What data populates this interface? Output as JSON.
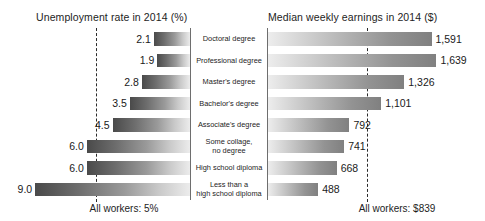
{
  "chart_data": {
    "type": "bar",
    "layout": "back-to-back horizontal bar (tornado) chart",
    "categories": [
      "Doctoral degree",
      "Professional degree",
      "Master's degree",
      "Bachelor's degree",
      "Associate's degree",
      "Some collage,\nno degree",
      "High school diploma",
      "Less than a\nhigh school diploma"
    ],
    "series": [
      {
        "name": "Unemployment rate in 2014 (%)",
        "side": "left",
        "unit": "%",
        "values": [
          2.1,
          1.9,
          2.8,
          3.5,
          4.5,
          6.0,
          6.0,
          9.0
        ],
        "labels": [
          "2.1",
          "1.9",
          "2.8",
          "3.5",
          "4.5",
          "6.0",
          "6.0",
          "9.0"
        ],
        "axis_max": 10.0,
        "reference_line": {
          "value": 5,
          "label": "All workers: 5%"
        }
      },
      {
        "name": "Median weekly earnings in 2014 ($)",
        "side": "right",
        "unit": "$",
        "values": [
          1591,
          1639,
          1326,
          1101,
          792,
          741,
          668,
          488
        ],
        "labels": [
          "1,591",
          "1,639",
          "1,326",
          "1,101",
          "792",
          "741",
          "668",
          "488"
        ],
        "axis_max": 1800,
        "reference_line": {
          "value": 839,
          "label": "All workers: $839"
        }
      }
    ],
    "grid": false,
    "legend": "none"
  },
  "panels": {
    "left": {
      "title": "Unemployment rate in 2014 (%)",
      "footnote": "All workers: 5%"
    },
    "right": {
      "title": "Median weekly earnings in 2014 ($)",
      "footnote": "All workers: $839"
    }
  },
  "rows": [
    {
      "category": "Doctoral degree",
      "line1": "Doctoral degree",
      "line2": "",
      "rate": "2.1",
      "earnings": "1,591"
    },
    {
      "category": "Professional degree",
      "line1": "Professional degree",
      "line2": "",
      "rate": "1.9",
      "earnings": "1,639"
    },
    {
      "category": "Master's degree",
      "line1": "Master's degree",
      "line2": "",
      "rate": "2.8",
      "earnings": "1,326"
    },
    {
      "category": "Bachelor's degree",
      "line1": "Bachelor's degree",
      "line2": "",
      "rate": "3.5",
      "earnings": "1,101"
    },
    {
      "category": "Associate's degree",
      "line1": "Associate's degree",
      "line2": "",
      "rate": "4.5",
      "earnings": "792"
    },
    {
      "category": "Some collage, no degree",
      "line1": "Some collage,",
      "line2": "no degree",
      "rate": "6.0",
      "earnings": "741"
    },
    {
      "category": "High school diploma",
      "line1": "High school diploma",
      "line2": "",
      "rate": "6.0",
      "earnings": "668"
    },
    {
      "category": "Less than a high school diploma",
      "line1": "Less than a",
      "line2": "high school diploma",
      "rate": "9.0",
      "earnings": "488"
    }
  ],
  "colors": {
    "bar_dark": "#4a4a4a",
    "bar_light": "#ececec",
    "axis": "#6e6e6e",
    "reference_line": "#2b2b2b",
    "text": "#1a1a1a",
    "background": "#ffffff"
  }
}
